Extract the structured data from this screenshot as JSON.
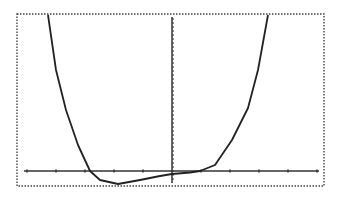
{
  "chart_data": {
    "type": "line",
    "title": "",
    "xlabel": "",
    "ylabel": "",
    "xlim": [
      -5.3,
      5.3
    ],
    "ylim_visual": "bottom slightly below zero, top off-screen",
    "grid": false,
    "legend": "none",
    "x_tick_spacing": 1,
    "x_ticks": [
      -5,
      -4,
      -3,
      -2,
      -1,
      0,
      1,
      2,
      3,
      4,
      5
    ],
    "y_ticks": "dense small ticks along y-axis",
    "series": [
      {
        "name": "f(x)",
        "description": "quartic-like curve: steep from top-left, crosses x-axis near x=-2.8, minimum near x=-1.9 just below axis, flat near origin slightly below axis, crosses near x=1, rises steeply to top-right",
        "x": [
          -4.3,
          -4.0,
          -3.6,
          -3.2,
          -2.8,
          -2.5,
          -1.9,
          -1.1,
          -0.4,
          0.0,
          0.6,
          1.0,
          1.5,
          2.1,
          2.6,
          3.0,
          3.3
        ],
        "y_pixel_offset_from_axis": [
          156,
          101,
          61,
          26,
          0,
          -9,
          -13,
          -9,
          -5,
          -3,
          -1.5,
          0,
          6,
          31,
          63,
          101,
          156
        ]
      }
    ],
    "colors": {
      "curve": "#222222",
      "axes": "#333333",
      "frame": "#444444",
      "background": "#ffffff"
    }
  },
  "screen": {
    "frame": {
      "left": 17,
      "top": 14,
      "right": 324,
      "bottom": 186
    },
    "origin_px": {
      "x": 172,
      "y": 171
    },
    "x_unit_px": 29,
    "curve_points_px": [
      [
        48,
        15
      ],
      [
        56,
        70
      ],
      [
        66,
        110
      ],
      [
        78,
        145
      ],
      [
        90,
        171
      ],
      [
        100,
        180
      ],
      [
        118,
        184
      ],
      [
        140,
        180
      ],
      [
        160,
        176
      ],
      [
        172,
        174
      ],
      [
        190,
        172.5
      ],
      [
        200,
        171
      ],
      [
        215,
        165
      ],
      [
        232,
        140
      ],
      [
        248,
        108
      ],
      [
        258,
        70
      ],
      [
        268,
        15
      ]
    ]
  },
  "labels": {
    "aria_title": "Graphing calculator plot of a quartic function"
  }
}
